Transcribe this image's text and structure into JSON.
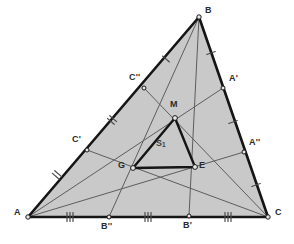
{
  "figure": {
    "background_color": "#ffffff",
    "fill_color": "#c9c9c9",
    "outer_stroke_color": "#151515",
    "inner_stroke_color": "#151515",
    "cevian_stroke_color": "#5d5d5d",
    "tick_color": "#4a4a4a",
    "point_fill_color": "#e8e8e8",
    "point_stroke_color": "#1a1a1a"
  },
  "points": {
    "A": {
      "label": "A",
      "x": 28,
      "y": 217,
      "label_x": 14,
      "label_y": 212
    },
    "B": {
      "label": "B",
      "x": 199,
      "y": 17,
      "label_x": 205,
      "label_y": 10
    },
    "C": {
      "label": "C",
      "x": 268,
      "y": 217,
      "label_x": 275,
      "label_y": 212
    },
    "Ap": {
      "label": "A'",
      "x": 223,
      "y": 88,
      "label_x": 229,
      "label_y": 78
    },
    "Bp": {
      "label": "B'",
      "x": 189,
      "y": 216,
      "label_x": 183,
      "label_y": 225
    },
    "Cp": {
      "label": "C'",
      "x": 87,
      "y": 150,
      "label_x": 73,
      "label_y": 139
    },
    "App": {
      "label": "A''",
      "x": 244,
      "y": 152,
      "label_x": 249,
      "label_y": 142
    },
    "Bpp": {
      "label": "B''",
      "x": 109,
      "y": 217,
      "label_x": 103,
      "label_y": 226
    },
    "Cpp": {
      "label": "C''",
      "x": 144,
      "y": 88,
      "label_x": 130,
      "label_y": 77
    },
    "M": {
      "label": "M",
      "x": 175,
      "y": 118,
      "label_x": 170,
      "label_y": 104
    },
    "G": {
      "label": "G",
      "x": 133,
      "y": 168,
      "label_x": 119,
      "label_y": 164
    },
    "E": {
      "label": "E",
      "x": 195,
      "y": 167,
      "label_x": 199,
      "label_y": 165
    }
  },
  "regions": {
    "inner_triangle_label": "S",
    "inner_triangle_subscript": "1",
    "inner_triangle_label_x": 158,
    "inner_triangle_label_y": 142
  },
  "outer_triangle": {
    "name": "triangle-ABC",
    "vertices": [
      "A",
      "B",
      "C"
    ]
  },
  "inner_triangle": {
    "name": "triangle-MGE",
    "vertices": [
      "M",
      "G",
      "E"
    ]
  },
  "edge_ticks": [
    {
      "edge": "AB",
      "count": 2,
      "x": 57,
      "y": 175,
      "angle": -49
    },
    {
      "edge": "AB",
      "count": 2,
      "x": 112,
      "y": 120,
      "angle": -49
    },
    {
      "edge": "AB",
      "count": 1,
      "x": 166,
      "y": 59,
      "angle": -49
    },
    {
      "edge": "BC",
      "count": 1,
      "x": 211,
      "y": 53,
      "angle": 71
    },
    {
      "edge": "BC",
      "count": 1,
      "x": 233,
      "y": 122,
      "angle": 71
    },
    {
      "edge": "BC",
      "count": 1,
      "x": 256,
      "y": 185,
      "angle": 71
    },
    {
      "edge": "AC",
      "count": 3,
      "x": 70,
      "y": 217,
      "angle": 0
    },
    {
      "edge": "AC",
      "count": 3,
      "x": 148,
      "y": 217,
      "angle": 0
    },
    {
      "edge": "AC",
      "count": 3,
      "x": 228,
      "y": 217,
      "angle": 0
    }
  ],
  "cevians": [
    {
      "name": "cevian-A-to-Ap",
      "from": "A",
      "to": "Ap"
    },
    {
      "name": "cevian-A-to-App",
      "from": "A",
      "to": "App"
    },
    {
      "name": "cevian-B-to-Bp",
      "from": "B",
      "to": "Bp"
    },
    {
      "name": "cevian-B-to-Bpp",
      "from": "B",
      "to": "Bpp"
    },
    {
      "name": "cevian-C-to-Cp",
      "from": "C",
      "to": "Cp"
    },
    {
      "name": "cevian-C-to-Cpp",
      "from": "C",
      "to": "Cpp"
    }
  ]
}
